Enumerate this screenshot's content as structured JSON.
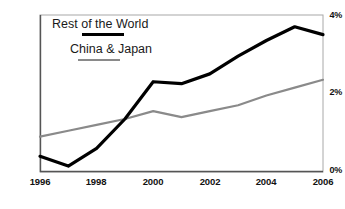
{
  "chart_data": {
    "type": "line",
    "title": "",
    "subtitle": "",
    "xlabel": "",
    "ylabel": "",
    "x": [
      1996,
      1997,
      1998,
      1999,
      2000,
      2001,
      2002,
      2003,
      2004,
      2005,
      2006
    ],
    "xlim": [
      1996,
      2006
    ],
    "ylim": [
      0,
      4
    ],
    "x_tick_labels": [
      "1996",
      "1998",
      "2000",
      "2002",
      "2004",
      "2006"
    ],
    "x_tick_values": [
      1996,
      1998,
      2000,
      2002,
      2004,
      2006
    ],
    "y_tick_labels": [
      "0%",
      "2%",
      "4%"
    ],
    "y_tick_values": [
      0,
      2,
      4
    ],
    "y_unit": "%",
    "grid": false,
    "legend_position": "inside-top-left",
    "series": [
      {
        "name": "Rest of the World",
        "color": "#000000",
        "line_width": 3.2,
        "values": [
          0.4,
          0.15,
          0.6,
          1.35,
          2.3,
          2.25,
          2.5,
          2.95,
          3.35,
          3.7,
          3.5
        ]
      },
      {
        "name": "China & Japan",
        "color": "#8a8a8a",
        "line_width": 2.2,
        "values": [
          0.9,
          1.05,
          1.2,
          1.35,
          1.55,
          1.4,
          1.55,
          1.7,
          1.95,
          2.15,
          2.35
        ]
      }
    ]
  },
  "axes": {
    "y_ticks": [
      {
        "label": "4%",
        "value": 4
      },
      {
        "label": "2%",
        "value": 2
      },
      {
        "label": "0%",
        "value": 0
      }
    ],
    "x_ticks": [
      {
        "label": "1996",
        "value": 1996
      },
      {
        "label": "1998",
        "value": 1998
      },
      {
        "label": "2000",
        "value": 2000
      },
      {
        "label": "2002",
        "value": 2002
      },
      {
        "label": "2004",
        "value": 2004
      },
      {
        "label": "2006",
        "value": 2006
      }
    ]
  },
  "legend": {
    "entries": [
      {
        "label": "Rest of the World",
        "color": "#000000"
      },
      {
        "label": "China & Japan",
        "color": "#8a8a8a"
      }
    ]
  },
  "style": {
    "background": "#ffffff",
    "axis_color": "#9a9a9a",
    "text_color": "#111111"
  }
}
